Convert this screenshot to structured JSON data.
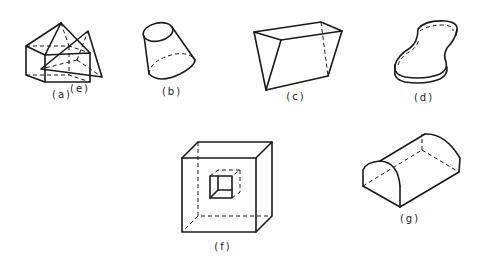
{
  "figure": {
    "colors": {
      "line": "#1a1a1a",
      "background": "#ffffff"
    },
    "shapes": [
      {
        "id": "a",
        "label": "(a)",
        "description": "pentagonal prism-like solid (box with pyramid roof)",
        "label_pos": [
          62,
          95
        ]
      },
      {
        "id": "b",
        "label": "(b)",
        "description": "truncated cone (frustum)",
        "label_pos": [
          172,
          92
        ]
      },
      {
        "id": "c",
        "label": "(c)",
        "description": "wedge / irregular prism",
        "label_pos": [
          296,
          97
        ]
      },
      {
        "id": "d",
        "label": "(d)",
        "description": "curved slab (peanut-shaped extrusion)",
        "label_pos": [
          424,
          98
        ]
      },
      {
        "id": "e",
        "label": "(e)",
        "description": "tetrahedron",
        "label_pos": [
          80,
          89
        ]
      },
      {
        "id": "f",
        "label": "(f)",
        "description": "cube with inner cubic cavity",
        "label_pos": [
          223,
          247
        ]
      },
      {
        "id": "g",
        "label": "(g)",
        "description": "half-cylinder",
        "label_pos": [
          410,
          219
        ]
      }
    ]
  }
}
